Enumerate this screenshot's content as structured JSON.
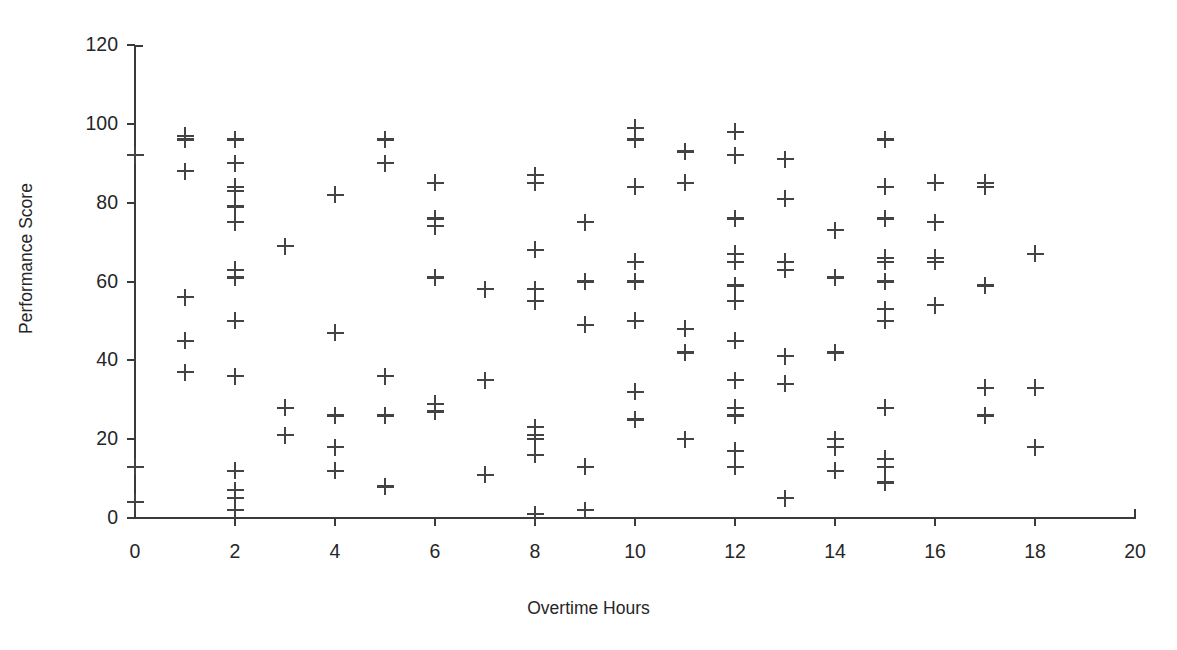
{
  "chart_data": {
    "type": "scatter",
    "title": "",
    "xlabel": "Overtime Hours",
    "ylabel": "Performance Score",
    "xlim": [
      0,
      20
    ],
    "ylim": [
      0,
      120
    ],
    "xticks": [
      0,
      2,
      4,
      6,
      8,
      10,
      12,
      14,
      16,
      18,
      20
    ],
    "yticks": [
      0,
      20,
      40,
      60,
      80,
      100,
      120
    ],
    "xtick_labels": [
      "0",
      "2",
      "4",
      "6",
      "8",
      "10",
      "12",
      "14",
      "16",
      "18",
      "20"
    ],
    "ytick_labels": [
      "0",
      "20",
      "40",
      "60",
      "80",
      "100",
      "120"
    ],
    "grid": false,
    "legend": null,
    "marker": "plus",
    "marker_color": "#434343",
    "series": [
      {
        "name": "Employees",
        "points": [
          [
            0,
            92
          ],
          [
            0,
            13
          ],
          [
            0,
            4
          ],
          [
            1,
            97
          ],
          [
            1,
            96
          ],
          [
            1,
            88
          ],
          [
            1,
            56
          ],
          [
            1,
            45
          ],
          [
            1,
            37
          ],
          [
            2,
            96
          ],
          [
            2,
            90
          ],
          [
            2,
            84
          ],
          [
            2,
            83
          ],
          [
            2,
            79
          ],
          [
            2,
            75
          ],
          [
            2,
            63
          ],
          [
            2,
            61
          ],
          [
            2,
            50
          ],
          [
            2,
            36
          ],
          [
            2,
            12
          ],
          [
            2,
            7
          ],
          [
            2,
            5
          ],
          [
            2,
            2
          ],
          [
            3,
            69
          ],
          [
            3,
            28
          ],
          [
            3,
            21
          ],
          [
            4,
            82
          ],
          [
            4,
            47
          ],
          [
            4,
            26
          ],
          [
            4,
            18
          ],
          [
            4,
            12
          ],
          [
            5,
            96
          ],
          [
            5,
            90
          ],
          [
            5,
            36
          ],
          [
            5,
            26
          ],
          [
            5,
            8
          ],
          [
            6,
            85
          ],
          [
            6,
            76
          ],
          [
            6,
            74
          ],
          [
            6,
            61
          ],
          [
            6,
            29
          ],
          [
            6,
            27
          ],
          [
            7,
            58
          ],
          [
            7,
            35
          ],
          [
            7,
            11
          ],
          [
            8,
            87
          ],
          [
            8,
            85
          ],
          [
            8,
            68
          ],
          [
            8,
            58
          ],
          [
            8,
            55
          ],
          [
            8,
            23
          ],
          [
            8,
            21
          ],
          [
            8,
            20
          ],
          [
            8,
            16
          ],
          [
            8,
            1
          ],
          [
            9,
            75
          ],
          [
            9,
            60
          ],
          [
            9,
            49
          ],
          [
            9,
            13
          ],
          [
            9,
            2
          ],
          [
            10,
            99
          ],
          [
            10,
            96
          ],
          [
            10,
            84
          ],
          [
            10,
            65
          ],
          [
            10,
            60
          ],
          [
            10,
            50
          ],
          [
            10,
            32
          ],
          [
            10,
            25
          ],
          [
            11,
            93
          ],
          [
            11,
            85
          ],
          [
            11,
            48
          ],
          [
            11,
            42
          ],
          [
            11,
            20
          ],
          [
            12,
            98
          ],
          [
            12,
            92
          ],
          [
            12,
            76
          ],
          [
            12,
            67
          ],
          [
            12,
            65
          ],
          [
            12,
            59
          ],
          [
            12,
            55
          ],
          [
            12,
            45
          ],
          [
            12,
            35
          ],
          [
            12,
            28
          ],
          [
            12,
            26
          ],
          [
            12,
            17
          ],
          [
            12,
            13
          ],
          [
            13,
            91
          ],
          [
            13,
            81
          ],
          [
            13,
            65
          ],
          [
            13,
            63
          ],
          [
            13,
            41
          ],
          [
            13,
            34
          ],
          [
            13,
            5
          ],
          [
            14,
            73
          ],
          [
            14,
            61
          ],
          [
            14,
            42
          ],
          [
            14,
            20
          ],
          [
            14,
            18
          ],
          [
            14,
            12
          ],
          [
            15,
            96
          ],
          [
            15,
            84
          ],
          [
            15,
            76
          ],
          [
            15,
            66
          ],
          [
            15,
            65
          ],
          [
            15,
            60
          ],
          [
            15,
            53
          ],
          [
            15,
            50
          ],
          [
            15,
            28
          ],
          [
            15,
            15
          ],
          [
            15,
            13
          ],
          [
            15,
            9
          ],
          [
            16,
            85
          ],
          [
            16,
            75
          ],
          [
            16,
            66
          ],
          [
            16,
            65
          ],
          [
            16,
            54
          ],
          [
            17,
            85
          ],
          [
            17,
            84
          ],
          [
            17,
            59
          ],
          [
            17,
            33
          ],
          [
            17,
            26
          ],
          [
            18,
            67
          ],
          [
            18,
            33
          ],
          [
            18,
            18
          ]
        ]
      }
    ]
  },
  "axes": {
    "y_title": "Performance Score",
    "x_title": "Overtime Hours"
  }
}
